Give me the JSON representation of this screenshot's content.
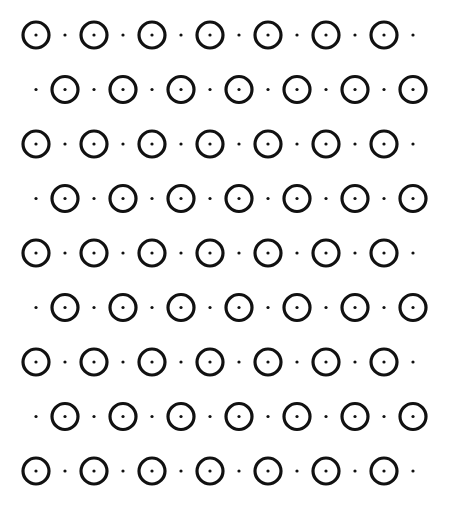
{
  "pattern": {
    "rows": 9,
    "cols": 7,
    "row_y": [
      35,
      89.5,
      144,
      198.5,
      253,
      307.5,
      362,
      416.5,
      471
    ],
    "x_start": 36,
    "x_step": 58,
    "half_step": 29,
    "circle_radius": 13,
    "circle_stroke": 3.2,
    "center_dot_radius": 1.6,
    "small_dot_radius": 1.6,
    "stroke_color": "#111111",
    "background": "#ffffff"
  }
}
